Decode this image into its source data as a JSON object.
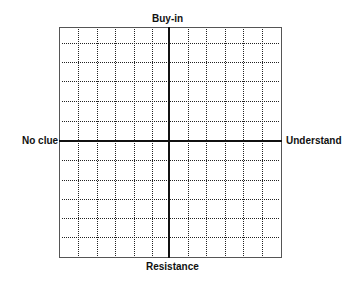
{
  "diagram": {
    "type": "quadrant-grid",
    "labels": {
      "top": "Buy-in",
      "bottom": "Resistance",
      "left": "No clue",
      "right": "Understand"
    },
    "frame": {
      "x": 59,
      "y": 27,
      "width": 223,
      "height": 231
    },
    "axes": {
      "vertical_x": 169,
      "horizontal_y": 141
    },
    "grid": {
      "columns": 12,
      "rows": 12,
      "vertical_lines_x": [
        78,
        97,
        115,
        134,
        152,
        188,
        206,
        225,
        243,
        262
      ],
      "horizontal_lines_y": [
        43,
        62,
        81,
        101,
        121,
        160,
        180,
        199,
        218,
        237
      ],
      "line_style": "dotted"
    },
    "colors": {
      "frame": "#555555",
      "axis": "#111111",
      "grid": "#222222",
      "text": "#111111"
    }
  }
}
